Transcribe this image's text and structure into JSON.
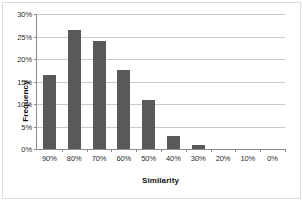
{
  "chart_data": {
    "type": "bar",
    "title": "",
    "xlabel": "Similarity",
    "ylabel": "Frequency",
    "categories": [
      "90%",
      "80%",
      "70%",
      "60%",
      "50%",
      "40%",
      "30%",
      "20%",
      "10%",
      "0%"
    ],
    "values": [
      16.5,
      26.5,
      24.0,
      17.5,
      11.0,
      3.0,
      1.0,
      0.0,
      0.0,
      0.0
    ],
    "value_unit": "%",
    "ylim": [
      0,
      30
    ],
    "ytick_values": [
      0,
      5,
      10,
      15,
      20,
      25,
      30
    ],
    "ytick_labels": [
      "0%",
      "5%",
      "10%",
      "15%",
      "20%",
      "25%",
      "30%"
    ],
    "grid": "horizontal",
    "legend": "none",
    "bar_color": "#595959",
    "gridline_color": "#c9c9c9",
    "axis_color": "#8c8c8c",
    "background_color": "#ffffff"
  }
}
